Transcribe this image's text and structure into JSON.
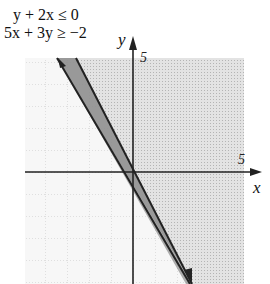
{
  "inequalities": [
    {
      "lhs": "y + 2x",
      "op": "≤",
      "rhs": "0"
    },
    {
      "lhs": "5x + 3y",
      "op": "≥",
      "rhs": "−2"
    }
  ],
  "axes": {
    "x_label": "x",
    "y_label": "y",
    "x_tick_label": "5",
    "y_tick_label": "5"
  },
  "graph": {
    "x_range": [
      -5,
      5
    ],
    "y_range": [
      -5,
      5
    ],
    "grid_step": 1,
    "lines": [
      {
        "equation": "y = -2x",
        "style": "solid"
      },
      {
        "equation": "5x + 3y = -2",
        "style": "solid"
      }
    ],
    "solution_region": "between the two lines (y ≤ -2x and 5x + 3y ≥ -2)",
    "colors": {
      "light_shade": "#d4d4d4",
      "wedge_shade": "#8a8a8a",
      "line": "#222222",
      "grid": "#c8c8c8"
    }
  }
}
